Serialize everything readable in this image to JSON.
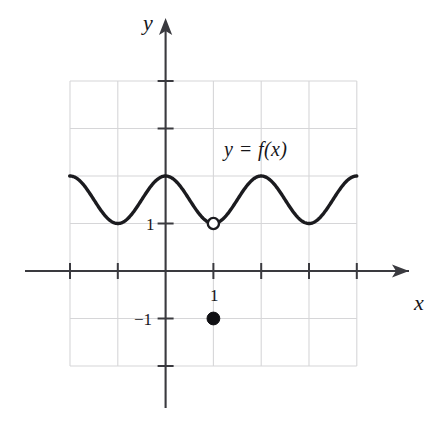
{
  "figure": {
    "title_label": "y = f(x)",
    "axis_labels": {
      "x": "x",
      "y": "y"
    },
    "tick_labels": {
      "y_one": "1",
      "y_negative_one": "−1",
      "x_one": "1"
    },
    "colors": {
      "curve": "#1b1b1f",
      "axis": "#3a3a3f",
      "grid": "#d6d6d8",
      "background": "#ffffff",
      "open_point_fill": "#ffffff",
      "closed_point_fill": "#111114"
    }
  },
  "chart_data": {
    "type": "line",
    "title": "y = f(x)",
    "xlabel": "x",
    "ylabel": "y",
    "xlim": [
      -3,
      3
    ],
    "ylim": [
      -3,
      3
    ],
    "grid": true,
    "grid_step": 1,
    "legend": "none",
    "x_ticks": [
      -3,
      -2,
      -1,
      1,
      2,
      3
    ],
    "y_ticks": [
      -3,
      -2,
      -1,
      1,
      2,
      3
    ],
    "x_tick_labels_shown": [
      "1"
    ],
    "y_tick_labels_shown": [
      "1",
      "−1"
    ],
    "series": [
      {
        "name": "f(x)",
        "description": "Cosine-like wave oscillating between y = 1 and y = 2 with period 2, maxima at x = -2, 0, 2 and minima at x = -1, 1, 3; drawn across the grid from x = -2.05 to x = 4",
        "formula": "y = 1.5 + 0.5*cos(pi*x)",
        "amplitude": 0.5,
        "midline": 1.5,
        "period": 2,
        "maxima_y": 2,
        "minima_y": 1,
        "x_domain": [
          -2.05,
          4.0
        ],
        "maxima_x": [
          -2,
          0,
          2,
          4
        ],
        "minima_x": [
          -1,
          1,
          3
        ]
      }
    ],
    "annotations": [
      {
        "kind": "open-circle",
        "x": 1,
        "y": 1,
        "meaning": "removable discontinuity: value not attained at x = 1"
      },
      {
        "kind": "filled-circle",
        "x": 1,
        "y": -1,
        "meaning": "defined value f(1) = -1"
      },
      {
        "kind": "text",
        "x": 1.2,
        "y": 2.55,
        "text": "y = f(x)"
      }
    ]
  }
}
